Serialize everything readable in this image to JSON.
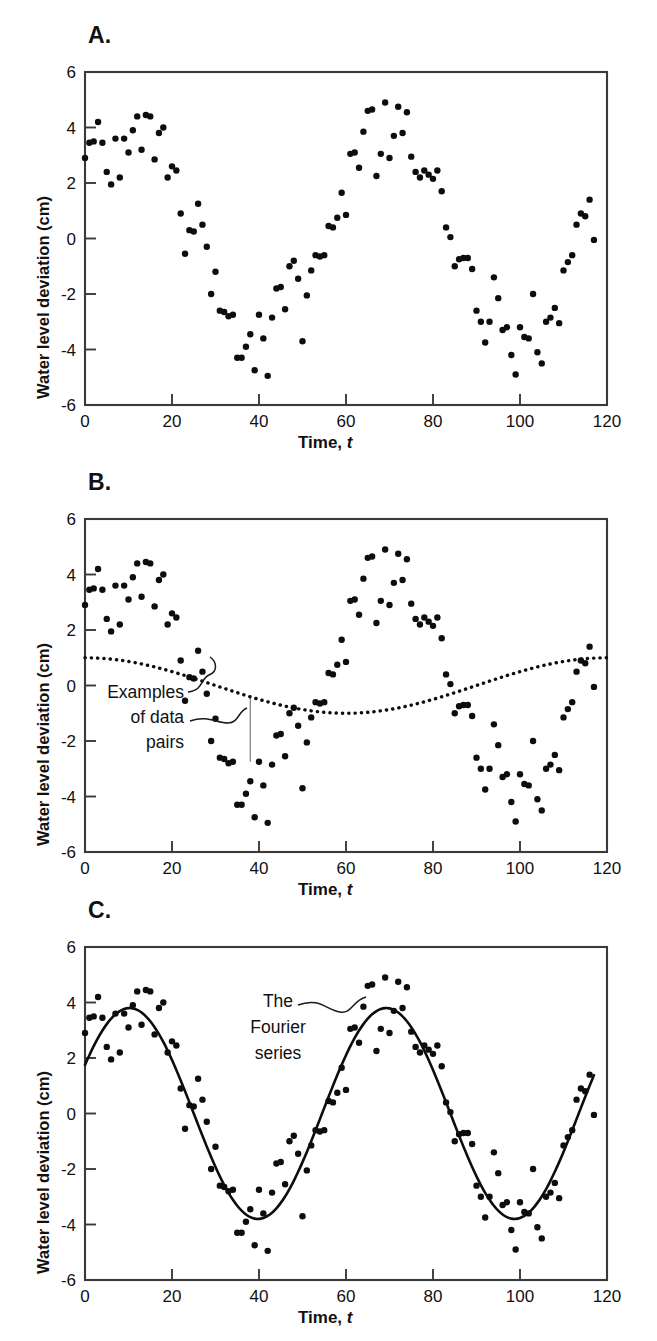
{
  "figure": {
    "axis": {
      "xlabel_main": "Time,",
      "xlabel_var": "t",
      "ylabel": "Water level deviation (cm)",
      "xticks": [
        "0",
        "20",
        "40",
        "60",
        "80",
        "100",
        "120"
      ],
      "xtick_values": [
        0,
        20,
        40,
        60,
        80,
        100,
        120
      ],
      "yticks": [
        "6",
        "4",
        "2",
        "0",
        "-2",
        "-4",
        "-6"
      ],
      "ytick_values": [
        6,
        4,
        2,
        0,
        -2,
        -4,
        -6
      ],
      "xlim": [
        0,
        120
      ],
      "ylim": [
        -6,
        6
      ]
    },
    "panels": [
      {
        "id": "A",
        "label": "A.",
        "has_dotted_curve": false,
        "has_fit_curve": false,
        "annotation": null
      },
      {
        "id": "B",
        "label": "B.",
        "has_dotted_curve": true,
        "has_fit_curve": false,
        "annotation": {
          "lines": [
            "Examples",
            "of data",
            "pairs"
          ]
        }
      },
      {
        "id": "C",
        "label": "C.",
        "has_dotted_curve": false,
        "has_fit_curve": true,
        "annotation": {
          "lines": [
            "The",
            "Fourier",
            "series"
          ]
        }
      }
    ]
  },
  "chart_data": {
    "type": "scatter",
    "title": "",
    "xlabel": "Time, t",
    "ylabel": "Water level deviation (cm)",
    "xlim": [
      0,
      120
    ],
    "ylim": [
      -6,
      6
    ],
    "grid": false,
    "legend": "none",
    "n_panels": 3,
    "panel_labels": [
      "A.",
      "B.",
      "C."
    ],
    "annotations": [
      {
        "panel": "B",
        "text": "Examples of data pairs",
        "points_to": "vertical segments between data points and the dotted curve"
      },
      {
        "panel": "C",
        "text": "The Fourier series",
        "points_to": "the fitted solid sinusoidal curve"
      }
    ],
    "scatter": {
      "name": "Water level deviation",
      "marker": "filled-circle",
      "color": "#0d0d0d",
      "x": [
        0,
        1,
        2,
        3,
        4,
        5,
        6,
        7,
        8,
        9,
        10,
        11,
        12,
        13,
        14,
        15,
        16,
        17,
        18,
        19,
        20,
        21,
        22,
        23,
        24,
        25,
        26,
        27,
        28,
        29,
        30,
        31,
        32,
        33,
        34,
        35,
        36,
        37,
        38,
        39,
        40,
        41,
        42,
        43,
        44,
        45,
        46,
        47,
        48,
        49,
        50,
        51,
        52,
        53,
        54,
        55,
        56,
        57,
        58,
        59,
        60,
        61,
        62,
        63,
        64,
        65,
        66,
        67,
        68,
        69,
        70,
        71,
        72,
        73,
        74,
        75,
        76,
        77,
        78,
        79,
        80,
        81,
        82,
        83,
        84,
        85,
        86,
        87,
        88,
        89,
        90,
        91,
        92,
        93,
        94,
        95,
        96,
        97,
        98,
        99,
        100,
        101,
        102,
        103,
        104,
        105,
        106,
        107,
        108,
        109,
        110,
        111,
        112,
        113,
        114,
        115,
        116,
        117
      ],
      "y": [
        2.9,
        3.45,
        3.5,
        4.2,
        3.45,
        2.4,
        1.95,
        3.6,
        2.2,
        3.6,
        3.1,
        3.9,
        4.4,
        3.2,
        4.45,
        4.4,
        2.85,
        3.8,
        4.0,
        2.2,
        2.6,
        2.45,
        0.9,
        -0.55,
        0.3,
        0.25,
        1.25,
        0.5,
        -0.3,
        -2.0,
        -1.2,
        -2.6,
        -2.65,
        -2.8,
        -2.75,
        -4.3,
        -4.3,
        -3.9,
        -3.45,
        -4.75,
        -2.75,
        -3.6,
        -4.95,
        -2.85,
        -1.8,
        -1.75,
        -2.55,
        -1.0,
        -0.8,
        -1.45,
        -3.7,
        -2.05,
        -1.15,
        -0.6,
        -0.65,
        -0.6,
        0.45,
        0.4,
        0.75,
        1.65,
        0.85,
        3.05,
        3.1,
        2.55,
        3.85,
        4.6,
        4.65,
        2.25,
        3.05,
        4.9,
        2.9,
        3.7,
        4.75,
        3.8,
        4.55,
        2.95,
        2.4,
        2.2,
        2.45,
        2.3,
        2.15,
        2.45,
        1.7,
        0.4,
        0.05,
        -1.0,
        -0.75,
        -0.7,
        -0.7,
        -1.1,
        -2.6,
        -3.0,
        -3.75,
        -3.0,
        -1.4,
        -2.15,
        -3.3,
        -3.2,
        -4.2,
        -4.9,
        -3.2,
        -3.55,
        -3.6,
        -2.0,
        -4.1,
        -4.5,
        -3.0,
        -2.85,
        -2.5,
        -3.05,
        -1.15,
        -0.85,
        -0.6,
        0.5,
        0.9,
        0.8,
        1.4,
        -0.05
      ]
    },
    "fitted_curve_panelC": {
      "name": "The Fourier series",
      "style": "solid",
      "equation_form": "y = A*sin(2*pi*(t - phi)/T)",
      "amplitude": 3.8,
      "period": 59,
      "phase_shift": -4.5,
      "vertical_offset": 0.0,
      "key_points": [
        {
          "t": 0,
          "y": 2.2
        },
        {
          "t": 10,
          "y": 3.8
        },
        {
          "t": 25,
          "y": 1.0
        },
        {
          "t": 39,
          "y": -3.7
        },
        {
          "t": 55,
          "y": -0.9
        },
        {
          "t": 69,
          "y": 3.75
        },
        {
          "t": 85,
          "y": -0.5
        },
        {
          "t": 99,
          "y": -3.75
        },
        {
          "t": 117,
          "y": 1.8
        }
      ]
    },
    "dotted_curve_panelB": {
      "name": "Low-frequency component",
      "style": "dotted",
      "amplitude": 1.0,
      "period": 120,
      "key_points": [
        {
          "t": 0,
          "y": 1.05
        },
        {
          "t": 20,
          "y": 0.75
        },
        {
          "t": 30,
          "y": 0.35
        },
        {
          "t": 45,
          "y": -0.55
        },
        {
          "t": 55,
          "y": -0.9
        },
        {
          "t": 70,
          "y": -0.85
        },
        {
          "t": 85,
          "y": -0.45
        },
        {
          "t": 100,
          "y": 0.25
        },
        {
          "t": 120,
          "y": 1.05
        }
      ]
    }
  }
}
